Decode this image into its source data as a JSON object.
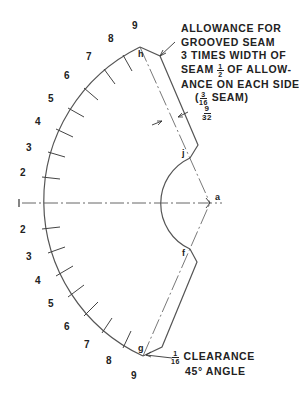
{
  "diagram": {
    "type": "sheet-metal pattern layout (flat pattern of elbow gore with grooved seam allowance)",
    "stroke_color": "#555555",
    "text_color": "#222222",
    "numbers_left_upper": [
      "9",
      "8",
      "7",
      "6",
      "5",
      "4",
      "3",
      "2"
    ],
    "center_number": "1",
    "numbers_left_lower": [
      "2",
      "3",
      "4",
      "5",
      "6",
      "7",
      "8",
      "9"
    ],
    "points": {
      "a": "a",
      "h": "h",
      "j": "j",
      "f": "f",
      "g": "g"
    },
    "notes": {
      "seam_allowance": {
        "line1": "ALLOWANCE FOR",
        "line2": "GROOVED SEAM",
        "line3": "3 TIMES WIDTH OF",
        "line4_pre": "SEAM",
        "line4_frac_num": "1",
        "line4_frac_den": "2",
        "line4_post": "OF ALLOW-",
        "line5": "ANCE ON EACH SIDE",
        "line6_pre": "(",
        "line6_frac_num": "3",
        "line6_frac_den": "16",
        "line6_post": "SEAM)"
      },
      "dimension": {
        "num": "9",
        "den": "32"
      },
      "clearance": {
        "frac_num": "1",
        "frac_den": "16",
        "line1": "CLEARANCE",
        "line2": "45° ANGLE"
      }
    }
  }
}
